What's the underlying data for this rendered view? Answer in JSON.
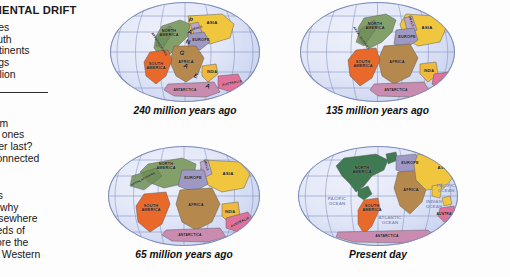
{
  "article": {
    "heading": "CONTINENTAL DRIFT",
    "paragraph1": [
      "al forces",
      "nd South",
      "er continents",
      "n beings",
      "wo million"
    ],
    "paragraph2": [
      "Which",
      "ted from",
      "Which ones",
      "ch other last?",
      "sely connected"
    ],
    "paragraph3": [
      "w does",
      "xplain why",
      "ped elsewhere",
      "hundreds of",
      "rs before the",
      "ed the Western"
    ]
  },
  "colors": {
    "ocean": "#d7dff3",
    "graticule": "#6f7fb4",
    "north_america": "#84a06a",
    "appalachians": "#6f8f58",
    "south_america": "#e8692a",
    "africa": "#b5884e",
    "europe": "#9d98c4",
    "asia": "#f0c63f",
    "urals": "#b9a7cf",
    "india": "#f0b93c",
    "australia": "#e0719b",
    "antarctica": "#c98bb0",
    "ocean_label": "#7e8dbb",
    "text": "#121212"
  },
  "figures": [
    {
      "id": "globe-240",
      "caption": "240 million years ago",
      "supercontinent_label": "PANGAEA",
      "labels": [
        {
          "name": "north-america",
          "text": "NORTH\nAMERICA"
        },
        {
          "name": "appalachians",
          "text": "APPALACHIANS"
        },
        {
          "name": "south-america",
          "text": "SOUTH\nAMERICA"
        },
        {
          "name": "africa",
          "text": "AFRICA"
        },
        {
          "name": "europe",
          "text": "EUROPE"
        },
        {
          "name": "urals",
          "text": "URALS"
        },
        {
          "name": "asia",
          "text": "ASIA"
        },
        {
          "name": "india",
          "text": "INDIA"
        },
        {
          "name": "australia",
          "text": "AUSTRALIA"
        },
        {
          "name": "antarctica",
          "text": "ANTARCTICA"
        }
      ]
    },
    {
      "id": "globe-135",
      "caption": "135 million years ago",
      "supercontinent_label": "",
      "labels": [
        {
          "name": "north-america",
          "text": "NORTH\nAMERICA"
        },
        {
          "name": "appalachians",
          "text": "APPALACHIANS"
        },
        {
          "name": "south-america",
          "text": "SOUTH\nAMERICA"
        },
        {
          "name": "africa",
          "text": "AFRICA"
        },
        {
          "name": "europe",
          "text": "EUROPE"
        },
        {
          "name": "urals",
          "text": "URALS"
        },
        {
          "name": "asia",
          "text": "ASIA"
        },
        {
          "name": "india",
          "text": "INDIA"
        },
        {
          "name": "australia",
          "text": "AUSTRALIA"
        },
        {
          "name": "antarctica",
          "text": "ANTARCTICA"
        }
      ]
    },
    {
      "id": "globe-65",
      "caption": "65 million years ago",
      "supercontinent_label": "",
      "labels": [
        {
          "name": "north-america",
          "text": "NORTH\nAMERICA"
        },
        {
          "name": "appalachians",
          "text": "APPALACHIANS"
        },
        {
          "name": "south-america",
          "text": "SOUTH\nAMERICA"
        },
        {
          "name": "africa",
          "text": "AFRICA"
        },
        {
          "name": "europe",
          "text": "EUROPE"
        },
        {
          "name": "urals",
          "text": "URALS"
        },
        {
          "name": "asia",
          "text": "ASIA"
        },
        {
          "name": "india",
          "text": "INDIA"
        },
        {
          "name": "australia",
          "text": "AUSTRALIA"
        },
        {
          "name": "antarctica",
          "text": "ANTARCTICA"
        }
      ]
    },
    {
      "id": "globe-present",
      "caption": "Present day",
      "supercontinent_label": "",
      "labels": [
        {
          "name": "north-america",
          "text": "NORTH\nAMERICA"
        },
        {
          "name": "south-america",
          "text": "SOUTH\nAMERICA"
        },
        {
          "name": "africa",
          "text": "AFRICA"
        },
        {
          "name": "europe",
          "text": "EUROPE"
        },
        {
          "name": "asia",
          "text": "ASIA"
        },
        {
          "name": "australia",
          "text": "AUSTRALIA"
        },
        {
          "name": "antarctica",
          "text": "ANTARCTICA"
        },
        {
          "name": "pacific-ocean-west",
          "text": "PACIFIC\nOCEAN"
        },
        {
          "name": "atlantic-ocean",
          "text": "ATLANTIC\nOCEAN"
        },
        {
          "name": "indian-ocean",
          "text": "INDIAN\nOCEAN"
        },
        {
          "name": "pacific-ocean-east",
          "text": "PACIFIC\nOCEAN"
        }
      ]
    }
  ]
}
